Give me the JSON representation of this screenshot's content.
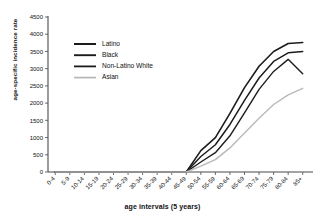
{
  "chart_data": {
    "type": "line",
    "title": "",
    "xlabel": "age intervals (5 years)",
    "ylabel": "age-specific incidence rate",
    "categories": [
      "0-4",
      "5-9",
      "10-14",
      "15-19",
      "20-24",
      "25-29",
      "30-34",
      "35-39",
      "40-44",
      "45-49",
      "50-54",
      "55-59",
      "60-64",
      "65-69",
      "70-74",
      "75-79",
      "80-84",
      "85+"
    ],
    "ylim": [
      0,
      4500
    ],
    "yticks": [
      0,
      500,
      1000,
      1500,
      2000,
      2500,
      3000,
      3500,
      4000,
      4500
    ],
    "ytick_labels": [
      "0",
      "500",
      "1000",
      "1500",
      "2000",
      "2500",
      "3000",
      "3500",
      "4000",
      "4500"
    ],
    "grid": false,
    "legend_position": "upper-left-inside",
    "series": [
      {
        "name": "Latino",
        "color": "#1c1c1c",
        "width": 1.6,
        "values": [
          0,
          0,
          0,
          0,
          0,
          0,
          0,
          0,
          0,
          0,
          620,
          1000,
          1700,
          2450,
          3070,
          3500,
          3730,
          3760
        ]
      },
      {
        "name": "Black",
        "color": "#1c1c1c",
        "width": 1.5,
        "values": [
          0,
          0,
          0,
          0,
          0,
          0,
          0,
          0,
          0,
          0,
          450,
          790,
          1380,
          2080,
          2730,
          3210,
          3460,
          3500
        ]
      },
      {
        "name": "Non-Latino White",
        "color": "#1c1c1c",
        "width": 1.4,
        "values": [
          0,
          0,
          0,
          0,
          0,
          0,
          0,
          0,
          0,
          0,
          290,
          560,
          1050,
          1720,
          2400,
          2920,
          3270,
          2850
        ]
      },
      {
        "name": "Asian",
        "color": "#b9b9b9",
        "width": 1.4,
        "values": [
          0,
          0,
          0,
          0,
          0,
          0,
          0,
          0,
          0,
          0,
          170,
          360,
          700,
          1130,
          1560,
          1960,
          2240,
          2430
        ]
      }
    ]
  }
}
